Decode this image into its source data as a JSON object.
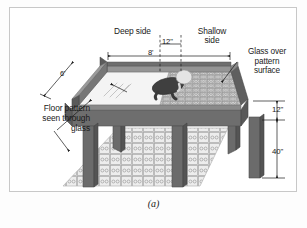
{
  "figure": {
    "caption": "(a)"
  },
  "labels": {
    "deep_side": "Deep side",
    "shallow_side": "Shallow\nside",
    "glass_over_pattern": "Glass over\npattern\nsurface",
    "floor_pattern": "Floor pattern\nseen through\nglass"
  },
  "dimensions": {
    "center_gap": "12\"",
    "table_length": "8'",
    "table_width": "6'",
    "frame_depth": "12\"",
    "leg_height": "40\""
  },
  "colors": {
    "frame_dark": "#6e6e6e",
    "frame_darker": "#5a5a5a",
    "frame_top": "#8e8e8e",
    "leg": "#676767",
    "glass_tint": "#f2f2f2",
    "pattern_fill": "#d8d8d8",
    "floor_fill": "#ededed",
    "border": "#c8c8c8",
    "ink": "#1a1a1a",
    "baby_body": "#4a4a4a",
    "baby_head": "#e8e8e8"
  }
}
